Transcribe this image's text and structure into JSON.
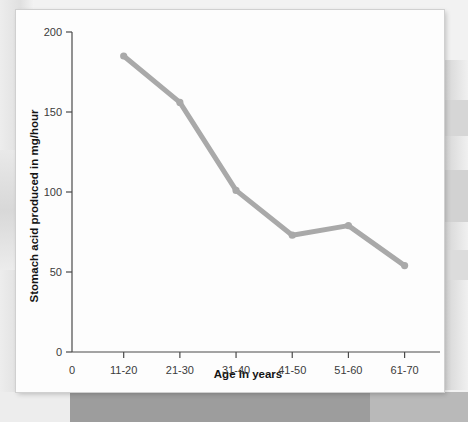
{
  "chart_data": {
    "type": "line",
    "title": "",
    "xlabel": "Age in years",
    "ylabel": "Stomach acid produced in mg/hour",
    "categories": [
      "11-20",
      "21-30",
      "31-40",
      "41-50",
      "51-60",
      "61-70"
    ],
    "values": [
      185,
      156,
      101,
      73,
      79,
      54
    ],
    "series": [
      {
        "name": "Stomach acid produced",
        "values": [
          185,
          156,
          101,
          73,
          79,
          54
        ]
      }
    ],
    "x_origin_label": "0",
    "y_ticks": [
      0,
      50,
      100,
      150,
      200
    ],
    "y_tick_labels": [
      "0",
      "50",
      "100",
      "150",
      "200"
    ],
    "ylim": [
      0,
      200
    ],
    "grid": false,
    "legend": "none",
    "line_color": "#a9a9a9",
    "axis_color": "#4a4a4a",
    "marker": "circle"
  },
  "figure": {
    "background_color": "#fdfdfd",
    "page_background_color": "#f2f2f2"
  }
}
